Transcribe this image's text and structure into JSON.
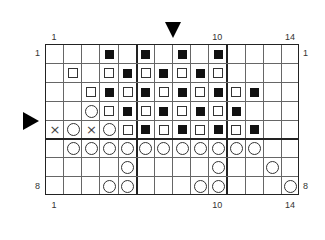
{
  "chart": {
    "columns": 14,
    "rows": 8,
    "top_labels": [
      {
        "col": 1,
        "text": "1"
      },
      {
        "col": 10,
        "text": "10"
      },
      {
        "col": 14,
        "text": "14"
      }
    ],
    "bottom_labels": [
      {
        "col": 1,
        "text": "1"
      },
      {
        "col": 10,
        "text": "10"
      },
      {
        "col": 14,
        "text": "14"
      }
    ],
    "left_labels": [
      {
        "row": 1,
        "text": "1"
      },
      {
        "row": 8,
        "text": "8"
      }
    ],
    "right_labels": [
      {
        "row": 1,
        "text": "1"
      },
      {
        "row": 8,
        "text": "8"
      }
    ],
    "thick_vertical_after_cols": [
      5,
      10
    ],
    "thick_horizontal_after_rows": [
      5
    ],
    "markers": [
      {
        "type": "arrow-down",
        "position": "between columns 7 and 8, above grid"
      },
      {
        "type": "arrow-right",
        "position": "left of grid at row 5"
      }
    ],
    "legend_symbols": {
      "filled": "filled square",
      "open": "open square",
      "circle": "circle",
      "cross": "cross"
    },
    "cells": [
      {
        "row": 1,
        "col": 4,
        "s": "filled"
      },
      {
        "row": 1,
        "col": 6,
        "s": "filled"
      },
      {
        "row": 1,
        "col": 8,
        "s": "filled"
      },
      {
        "row": 1,
        "col": 10,
        "s": "filled"
      },
      {
        "row": 2,
        "col": 2,
        "s": "open"
      },
      {
        "row": 2,
        "col": 4,
        "s": "open"
      },
      {
        "row": 2,
        "col": 5,
        "s": "filled"
      },
      {
        "row": 2,
        "col": 6,
        "s": "open"
      },
      {
        "row": 2,
        "col": 7,
        "s": "filled"
      },
      {
        "row": 2,
        "col": 8,
        "s": "open"
      },
      {
        "row": 2,
        "col": 9,
        "s": "filled"
      },
      {
        "row": 2,
        "col": 10,
        "s": "open"
      },
      {
        "row": 3,
        "col": 3,
        "s": "open"
      },
      {
        "row": 3,
        "col": 4,
        "s": "filled"
      },
      {
        "row": 3,
        "col": 5,
        "s": "open"
      },
      {
        "row": 3,
        "col": 6,
        "s": "filled"
      },
      {
        "row": 3,
        "col": 7,
        "s": "open"
      },
      {
        "row": 3,
        "col": 8,
        "s": "filled"
      },
      {
        "row": 3,
        "col": 9,
        "s": "open"
      },
      {
        "row": 3,
        "col": 10,
        "s": "filled"
      },
      {
        "row": 3,
        "col": 11,
        "s": "open"
      },
      {
        "row": 3,
        "col": 12,
        "s": "filled"
      },
      {
        "row": 4,
        "col": 3,
        "s": "circle"
      },
      {
        "row": 4,
        "col": 4,
        "s": "open"
      },
      {
        "row": 4,
        "col": 5,
        "s": "filled"
      },
      {
        "row": 4,
        "col": 6,
        "s": "open"
      },
      {
        "row": 4,
        "col": 7,
        "s": "filled"
      },
      {
        "row": 4,
        "col": 8,
        "s": "open"
      },
      {
        "row": 4,
        "col": 9,
        "s": "filled"
      },
      {
        "row": 4,
        "col": 10,
        "s": "open"
      },
      {
        "row": 4,
        "col": 11,
        "s": "filled"
      },
      {
        "row": 5,
        "col": 1,
        "s": "cross"
      },
      {
        "row": 5,
        "col": 2,
        "s": "circle"
      },
      {
        "row": 5,
        "col": 3,
        "s": "cross"
      },
      {
        "row": 5,
        "col": 4,
        "s": "circle"
      },
      {
        "row": 5,
        "col": 5,
        "s": "open"
      },
      {
        "row": 5,
        "col": 6,
        "s": "filled"
      },
      {
        "row": 5,
        "col": 7,
        "s": "open"
      },
      {
        "row": 5,
        "col": 8,
        "s": "filled"
      },
      {
        "row": 5,
        "col": 9,
        "s": "open"
      },
      {
        "row": 5,
        "col": 10,
        "s": "filled"
      },
      {
        "row": 5,
        "col": 11,
        "s": "open"
      },
      {
        "row": 5,
        "col": 12,
        "s": "filled"
      },
      {
        "row": 6,
        "col": 2,
        "s": "circle"
      },
      {
        "row": 6,
        "col": 3,
        "s": "circle"
      },
      {
        "row": 6,
        "col": 4,
        "s": "circle"
      },
      {
        "row": 6,
        "col": 5,
        "s": "circle"
      },
      {
        "row": 6,
        "col": 6,
        "s": "circle"
      },
      {
        "row": 6,
        "col": 7,
        "s": "circle"
      },
      {
        "row": 6,
        "col": 8,
        "s": "circle"
      },
      {
        "row": 6,
        "col": 9,
        "s": "circle"
      },
      {
        "row": 6,
        "col": 10,
        "s": "circle"
      },
      {
        "row": 6,
        "col": 11,
        "s": "circle"
      },
      {
        "row": 6,
        "col": 12,
        "s": "circle"
      },
      {
        "row": 7,
        "col": 5,
        "s": "circle"
      },
      {
        "row": 7,
        "col": 10,
        "s": "circle"
      },
      {
        "row": 7,
        "col": 13,
        "s": "circle"
      },
      {
        "row": 8,
        "col": 4,
        "s": "circle"
      },
      {
        "row": 8,
        "col": 5,
        "s": "circle"
      },
      {
        "row": 8,
        "col": 9,
        "s": "circle"
      },
      {
        "row": 8,
        "col": 10,
        "s": "circle"
      },
      {
        "row": 8,
        "col": 14,
        "s": "circle"
      }
    ],
    "cross_glyph": "×"
  }
}
